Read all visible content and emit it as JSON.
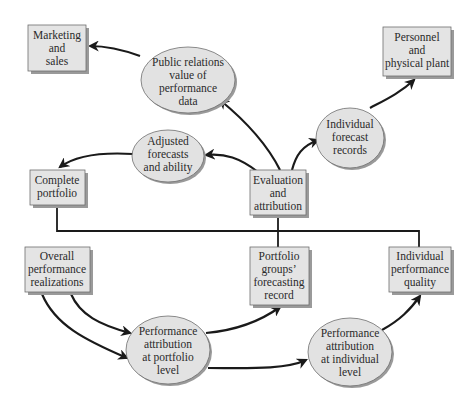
{
  "diagram": {
    "type": "flowchart",
    "nodes": {
      "marketing": {
        "shape": "box",
        "lines": [
          "Marketing",
          "and",
          "sales"
        ]
      },
      "public_relations": {
        "shape": "ellipse",
        "lines": [
          "Public relations",
          "value of",
          "performance",
          "data"
        ]
      },
      "personnel": {
        "shape": "box",
        "lines": [
          "Personnel",
          "and",
          "physical plant"
        ]
      },
      "individual_forecast": {
        "shape": "ellipse",
        "lines": [
          "Individual",
          "forecast",
          "records"
        ]
      },
      "adjusted": {
        "shape": "ellipse",
        "lines": [
          "Adjusted",
          "forecasts",
          "and ability"
        ]
      },
      "complete_portfolio": {
        "shape": "box",
        "lines": [
          "Complete",
          "portfolio"
        ]
      },
      "evaluation": {
        "shape": "box",
        "lines": [
          "Evaluation",
          "and",
          "attribution"
        ]
      },
      "overall": {
        "shape": "box",
        "lines": [
          "Overall",
          "performance",
          "realizations"
        ]
      },
      "portfolio_groups": {
        "shape": "box",
        "lines": [
          "Portfolio",
          "groups’",
          "forecasting",
          "record"
        ]
      },
      "individual_quality": {
        "shape": "box",
        "lines": [
          "Individual",
          "performance",
          "quality"
        ]
      },
      "attr_portfolio": {
        "shape": "ellipse",
        "lines": [
          "Performance",
          "attribution",
          "at portfolio",
          "level"
        ]
      },
      "attr_individual": {
        "shape": "ellipse",
        "lines": [
          "Performance",
          "attribution",
          "at individual",
          "level"
        ]
      }
    },
    "edges": [
      {
        "from": "public_relations",
        "to": "marketing"
      },
      {
        "from": "evaluation",
        "to": "public_relations"
      },
      {
        "from": "evaluation",
        "to": "adjusted"
      },
      {
        "from": "evaluation",
        "to": "individual_forecast"
      },
      {
        "from": "individual_forecast",
        "to": "personnel"
      },
      {
        "from": "adjusted",
        "to": "complete_portfolio"
      },
      {
        "from": "overall",
        "to": "attr_portfolio"
      },
      {
        "from": "overall",
        "to": "attr_portfolio"
      },
      {
        "from": "attr_portfolio",
        "to": "portfolio_groups"
      },
      {
        "from": "attr_portfolio",
        "to": "attr_individual"
      },
      {
        "from": "attr_individual",
        "to": "individual_quality"
      }
    ],
    "tree_connector": {
      "from": "evaluation",
      "to": [
        "complete_portfolio",
        "portfolio_groups",
        "individual_quality"
      ]
    },
    "colors": {
      "node_fill": "#e4e4e4",
      "node_stroke": "#6e6e6e",
      "shadow": "#9a9a9a",
      "edge": "#1a1a1a",
      "background": "#ffffff"
    }
  }
}
